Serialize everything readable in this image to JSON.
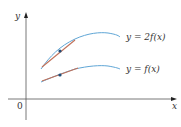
{
  "figure": {
    "axes": {
      "x_label": "x",
      "y_label": "y",
      "origin_label": "0",
      "axis_color": "#555555"
    },
    "curves": [
      {
        "name": "2f",
        "label": "y = 2f(x)",
        "curve_color": "#5fa6d6",
        "tangent_color": "#c0715a",
        "point_color": "#1f4e79"
      },
      {
        "name": "f",
        "label": "y = f(x)",
        "curve_color": "#5fa6d6",
        "tangent_color": "#c0715a",
        "point_color": "#1f4e79"
      }
    ]
  }
}
